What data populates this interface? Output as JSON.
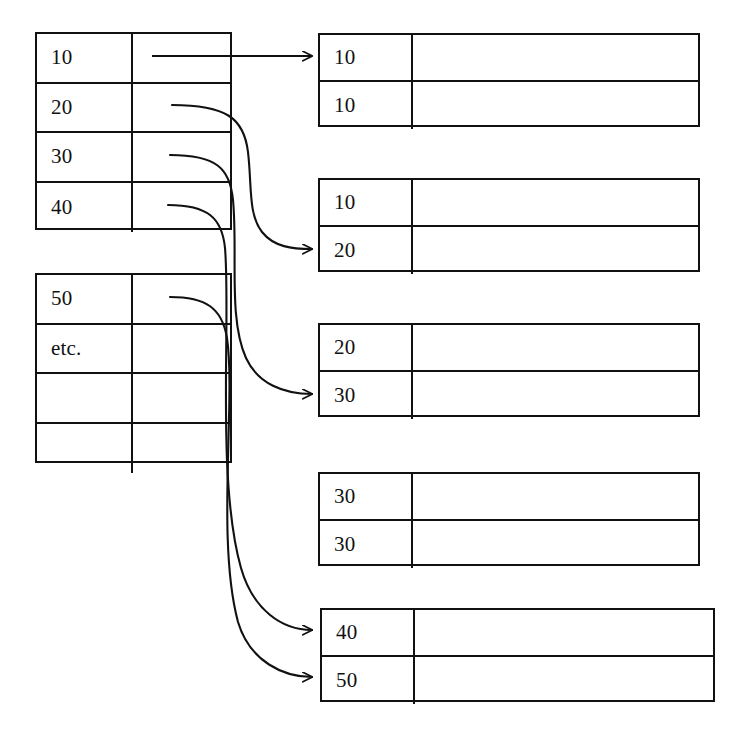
{
  "diagram": {
    "type": "join-merge-diagram",
    "stroke_color": "#111111",
    "background_color": "#ffffff",
    "source_tables": [
      {
        "name": "source-table-1",
        "rows": [
          {
            "key": "10",
            "value": ""
          },
          {
            "key": "20",
            "value": ""
          },
          {
            "key": "30",
            "value": ""
          },
          {
            "key": "40",
            "value": ""
          }
        ]
      },
      {
        "name": "source-table-2",
        "rows": [
          {
            "key": "50",
            "value": ""
          },
          {
            "key": "etc.",
            "value": ""
          },
          {
            "key": "",
            "value": ""
          },
          {
            "key": "",
            "value": ""
          }
        ]
      }
    ],
    "result_boxes": [
      {
        "name": "result-box-1",
        "rows": [
          {
            "key": "10",
            "value": ""
          },
          {
            "key": "10",
            "value": ""
          }
        ]
      },
      {
        "name": "result-box-2",
        "rows": [
          {
            "key": "10",
            "value": ""
          },
          {
            "key": "20",
            "value": ""
          }
        ]
      },
      {
        "name": "result-box-3",
        "rows": [
          {
            "key": "20",
            "value": ""
          },
          {
            "key": "30",
            "value": ""
          }
        ]
      },
      {
        "name": "result-box-4",
        "rows": [
          {
            "key": "30",
            "value": ""
          },
          {
            "key": "30",
            "value": ""
          }
        ]
      },
      {
        "name": "result-box-5",
        "rows": [
          {
            "key": "40",
            "value": ""
          },
          {
            "key": "50",
            "value": ""
          }
        ]
      }
    ],
    "connectors": [
      {
        "name": "connector-10-to-result-1-row-1",
        "from": "source-table-1.row-10",
        "to": "result-box-1.row-1",
        "style": "straight-arrow"
      },
      {
        "name": "connector-20-to-result-2-row-2",
        "from": "source-table-1.row-20",
        "to": "result-box-2.row-2",
        "style": "curved-arrow"
      },
      {
        "name": "connector-30-to-result-3-row-2",
        "from": "source-table-1.row-30",
        "to": "result-box-3.row-2",
        "style": "curved-arrow"
      },
      {
        "name": "connector-40-to-result-5-row-1",
        "from": "source-table-1.row-40",
        "to": "result-box-5.row-1",
        "style": "curved-arrow"
      },
      {
        "name": "connector-50-to-result-5-row-2",
        "from": "source-table-2.row-50",
        "to": "result-box-5.row-2",
        "style": "curved-arrow"
      }
    ]
  }
}
